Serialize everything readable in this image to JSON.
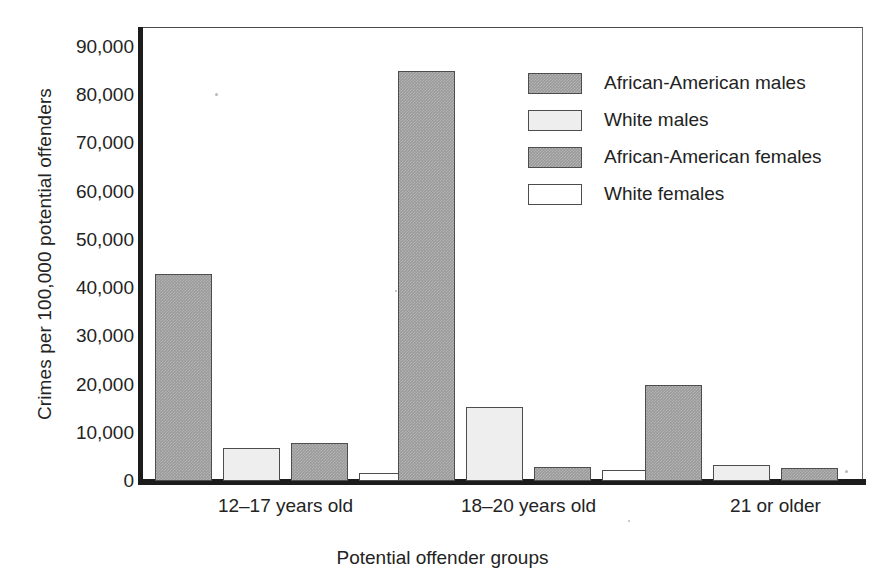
{
  "chart_data": {
    "type": "bar",
    "title": "",
    "subtitle": "",
    "xlabel": "Potential offender groups",
    "ylabel": "Crimes per 100,000 potential offenders",
    "categories": [
      "12–17 years old",
      "18–20 years old",
      "21 or older"
    ],
    "series": [
      {
        "name": "African-American males",
        "values": [
          43000,
          85000,
          20000
        ],
        "color": "#9b9b9b"
      },
      {
        "name": "White males",
        "values": [
          6800,
          15300,
          3300
        ],
        "color": "#eeeeee"
      },
      {
        "name": "African-American females",
        "values": [
          7900,
          3000,
          2600
        ],
        "color": "#9b9b9b"
      },
      {
        "name": "White females",
        "values": [
          1700,
          2300,
          0
        ],
        "color": "#ffffff"
      }
    ],
    "ylim": [
      0,
      90000
    ],
    "ytick_values": [
      0,
      10000,
      20000,
      30000,
      40000,
      50000,
      60000,
      70000,
      80000,
      90000
    ],
    "ytick_labels": [
      "0",
      "10,000",
      "20,000",
      "30,000",
      "40,000",
      "50,000",
      "60,000",
      "70,000",
      "80,000",
      "90,000"
    ],
    "grid": false,
    "legend_position": "upper-right",
    "legend_entries": [
      "African-American males",
      "White males",
      "African-American females",
      "White females"
    ]
  },
  "axis": {
    "y_title": "Crimes per 100,000 potential offenders",
    "x_title": "Potential offender groups"
  },
  "colors": {
    "series_dark_gray": "#9b9b9b",
    "series_light_gray": "#eeeeee",
    "series_white": "#ffffff",
    "axis_black": "#1c1c1c",
    "frame_gray": "#6a6a6a",
    "text": "#232323"
  }
}
